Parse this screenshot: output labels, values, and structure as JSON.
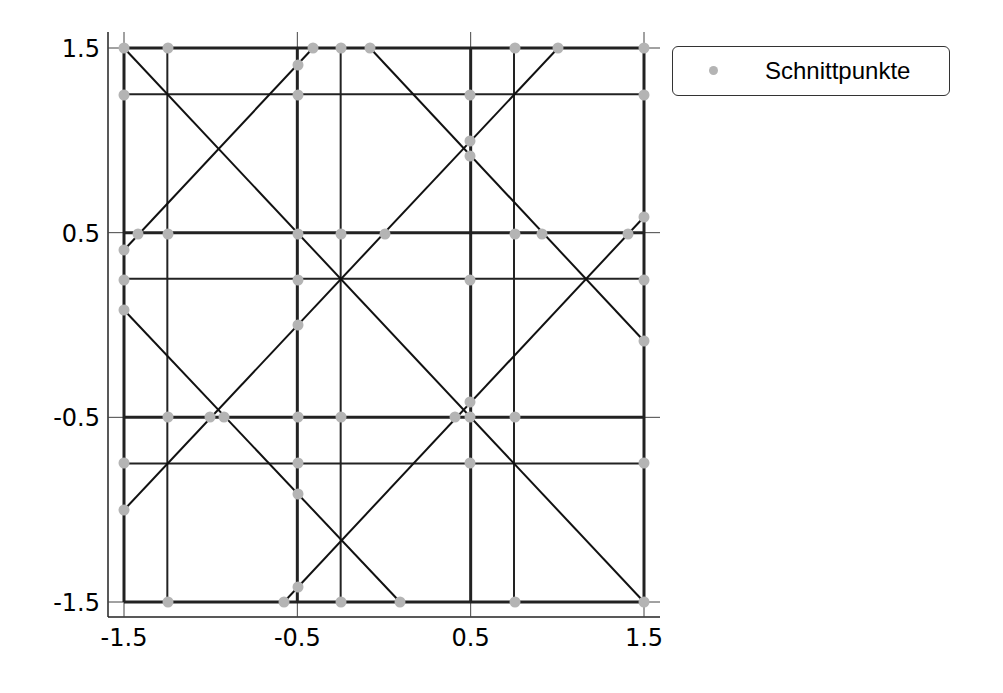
{
  "chart_data": {
    "type": "scatter",
    "title": "",
    "xlabel": "",
    "ylabel": "",
    "xlim": [
      -1.5,
      1.5
    ],
    "ylim": [
      -1.5,
      1.5
    ],
    "grid": false,
    "legend_position": "outside upper right",
    "x_ticks": [
      "-1.5",
      "-0.5",
      "0.5",
      "1.5"
    ],
    "y_ticks": [
      "1.5",
      "0.5",
      "-0.5",
      "-1.5"
    ],
    "legend": [
      {
        "label": "Schnittpunkte",
        "marker": "circle",
        "color": "#b4b4b4"
      }
    ],
    "lines": {
      "horizontal_y": [
        1.5,
        1.25,
        0.5,
        0.25,
        -0.5,
        -0.75,
        -1.5
      ],
      "vertical_x": [
        -1.5,
        -1.25,
        -0.5,
        -0.25,
        0.5,
        0.75,
        1.5
      ],
      "diagonals_px": [
        [
          124,
          48,
          644,
          602
        ],
        [
          124,
          250,
          313,
          48
        ],
        [
          124,
          310,
          400,
          602
        ],
        [
          124,
          510,
          558,
          48
        ],
        [
          370,
          48,
          644,
          341
        ],
        [
          284,
          602,
          644,
          217
        ]
      ]
    },
    "series": [
      {
        "name": "Schnittpunkte",
        "points_px": [
          [
            124,
            48
          ],
          [
            168,
            48
          ],
          [
            298,
            65
          ],
          [
            313,
            48
          ],
          [
            341,
            48
          ],
          [
            370,
            48
          ],
          [
            515,
            48
          ],
          [
            558,
            48
          ],
          [
            644,
            48
          ],
          [
            124,
            95
          ],
          [
            298,
            95
          ],
          [
            470,
            95
          ],
          [
            644,
            95
          ],
          [
            470,
            141
          ],
          [
            470,
            156
          ],
          [
            124,
            250
          ],
          [
            138,
            234
          ],
          [
            168,
            234
          ],
          [
            298,
            234
          ],
          [
            341,
            234
          ],
          [
            385,
            234
          ],
          [
            515,
            234
          ],
          [
            542,
            234
          ],
          [
            628,
            234
          ],
          [
            644,
            217
          ],
          [
            124,
            280
          ],
          [
            298,
            280
          ],
          [
            470,
            280
          ],
          [
            644,
            280
          ],
          [
            124,
            310
          ],
          [
            298,
            325
          ],
          [
            644,
            341
          ],
          [
            168,
            417
          ],
          [
            210,
            417
          ],
          [
            224,
            417
          ],
          [
            298,
            417
          ],
          [
            341,
            417
          ],
          [
            455,
            417
          ],
          [
            470,
            417
          ],
          [
            515,
            417
          ],
          [
            470,
            402
          ],
          [
            124,
            463
          ],
          [
            298,
            463
          ],
          [
            470,
            463
          ],
          [
            644,
            463
          ],
          [
            298,
            494
          ],
          [
            124,
            510
          ],
          [
            298,
            587
          ],
          [
            284,
            602
          ],
          [
            168,
            602
          ],
          [
            341,
            602
          ],
          [
            400,
            602
          ],
          [
            515,
            602
          ],
          [
            644,
            602
          ]
        ]
      }
    ]
  }
}
